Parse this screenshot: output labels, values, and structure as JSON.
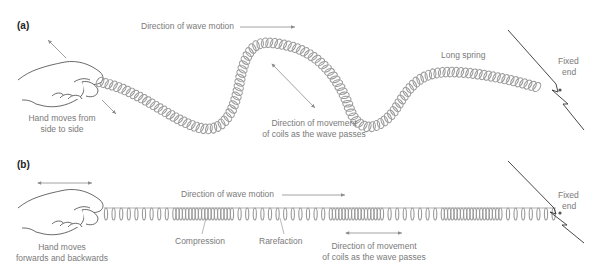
{
  "panels": [
    {
      "id": "a",
      "label": "(a)",
      "wave_type": "transverse",
      "labels": {
        "wave_direction": "Direction of wave motion",
        "hand": [
          "Hand moves from",
          "side to side"
        ],
        "coil_movement": [
          "Direction of movement",
          "of coils as the wave passes"
        ],
        "spring": "Long spring",
        "fixed_end": [
          "Fixed",
          "end"
        ]
      }
    },
    {
      "id": "b",
      "label": "(b)",
      "wave_type": "longitudinal",
      "labels": {
        "wave_direction": "Direction of wave motion",
        "hand": [
          "Hand moves",
          "forwards and backwards"
        ],
        "compression": "Compression",
        "rarefaction": "Rarefaction",
        "coil_movement": [
          "Direction of movement",
          "of coils as the wave passes"
        ],
        "fixed_end": [
          "Fixed",
          "end"
        ]
      }
    }
  ],
  "colors": {
    "spring": "#9a9a9a",
    "arrow": "#8a8a8a",
    "text": "#7a7a7a",
    "hand_outline": "#444444",
    "wall": "#333333"
  }
}
